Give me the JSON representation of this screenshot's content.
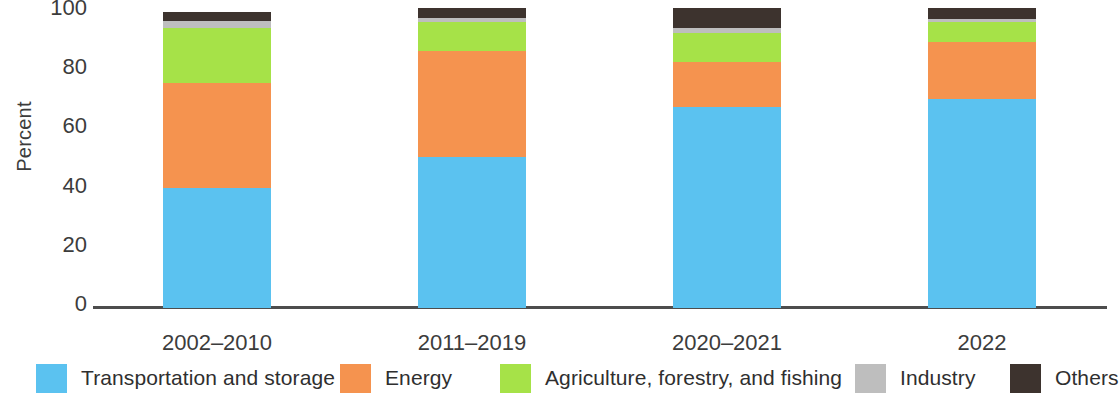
{
  "chart_data": {
    "type": "bar",
    "stacked": true,
    "title": "",
    "subtitle": "",
    "xlabel": "",
    "ylabel": "Percent",
    "ylim": [
      0,
      100
    ],
    "yticks": [
      0,
      20,
      40,
      60,
      80,
      100
    ],
    "ytick_labels": [
      "0",
      "20",
      "40",
      "60",
      "80",
      "100"
    ],
    "grid": false,
    "legend_position": "bottom",
    "categories": [
      "2002–2010",
      "2011–2019",
      "2020–2021",
      "2022"
    ],
    "series": [
      {
        "name": "Transportation and storage",
        "color": "#5bc2f0",
        "values": [
          40.5,
          51.0,
          68.0,
          70.5
        ]
      },
      {
        "name": "Energy",
        "color": "#f5934f",
        "values": [
          35.5,
          36.0,
          15.0,
          19.5
        ]
      },
      {
        "name": "Agriculture, forestry, and fishing",
        "color": "#a6e248",
        "values": [
          18.5,
          9.5,
          10.0,
          6.5
        ]
      },
      {
        "name": "Industry",
        "color": "#bebebe",
        "values": [
          2.5,
          1.5,
          1.5,
          1.0
        ]
      },
      {
        "name": "Others",
        "color": "#3d332e",
        "values": [
          3.0,
          3.5,
          7.0,
          4.0
        ]
      }
    ]
  },
  "axis": {
    "y_title": "Percent"
  },
  "legend": {
    "items": [
      {
        "label": "Transportation and storage",
        "color": "#5bc2f0"
      },
      {
        "label": "Energy",
        "color": "#f5934f"
      },
      {
        "label": "Agriculture, forestry, and fishing",
        "color": "#a6e248"
      },
      {
        "label": "Industry",
        "color": "#bebebe"
      },
      {
        "label": "Others",
        "color": "#3d332e"
      }
    ]
  },
  "colors": {
    "axis_line": "#4d4d4d",
    "text": "#3c3c3c",
    "background": "#ffffff"
  }
}
